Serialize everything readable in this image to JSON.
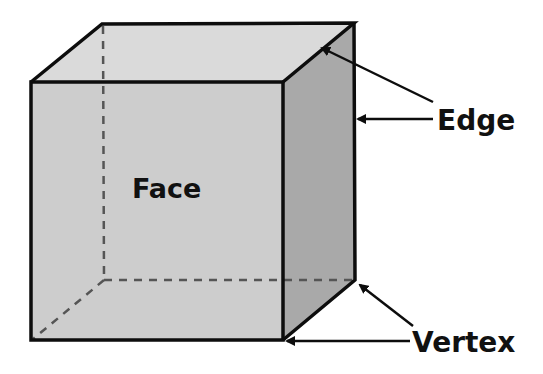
{
  "diagram": {
    "labels": {
      "face": "Face",
      "edge": "Edge",
      "vertex": "Vertex"
    },
    "colors": {
      "background": "#ffffff",
      "top_face": "#dadada",
      "front_face": "#cdcdcd",
      "side_face": "#a9a9a9",
      "edge_line": "#0d0d0d",
      "hidden_edge": "#555555",
      "text": "#111111"
    },
    "annotations": [
      {
        "label": "Edge",
        "points_to": [
          "top-right slanted edge",
          "back right vertical edge"
        ]
      },
      {
        "label": "Vertex",
        "points_to": [
          "back bottom-right corner",
          "front bottom-right corner"
        ]
      }
    ]
  }
}
